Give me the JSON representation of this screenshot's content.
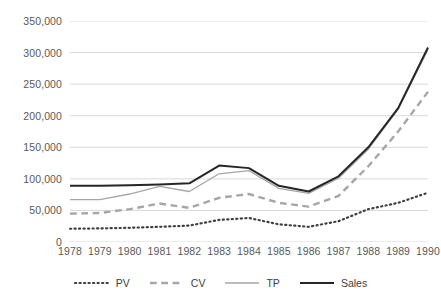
{
  "chart_data": {
    "type": "line",
    "title": "",
    "subtitle": "",
    "xlabel": "",
    "ylabel": "",
    "categories": [
      "1978",
      "1979",
      "1980",
      "1981",
      "1982",
      "1983",
      "1984",
      "1985",
      "1986",
      "1987",
      "1988",
      "1989",
      "1990"
    ],
    "x": [
      1978,
      1979,
      1980,
      1981,
      1982,
      1983,
      1984,
      1985,
      1986,
      1987,
      1989,
      1989,
      1990
    ],
    "ylim": [
      0,
      350000
    ],
    "xlim": [
      "1978",
      "1990"
    ],
    "y_ticks": [
      0,
      50000,
      100000,
      150000,
      200000,
      250000,
      300000,
      350000
    ],
    "y_tick_labels": [
      "0",
      "50,000",
      "100,000",
      "150,000",
      "200,000",
      "250,000",
      "300,000",
      "350,000"
    ],
    "grid": true,
    "grid_axis": "y",
    "legend_position": "bottom",
    "series": [
      {
        "name": "PV",
        "style": "dotted",
        "color": "#404040",
        "width": 2.2,
        "values": [
          21000,
          21500,
          22500,
          24000,
          26000,
          35000,
          38000,
          28000,
          24000,
          33000,
          52000,
          62000,
          78000
        ]
      },
      {
        "name": "CV",
        "style": "dashed",
        "color": "#a6a6a6",
        "width": 2.4,
        "values": [
          45000,
          46000,
          52000,
          61000,
          54000,
          70000,
          76000,
          62000,
          56000,
          73000,
          120000,
          175000,
          238000
        ]
      },
      {
        "name": "TP",
        "style": "solid",
        "color": "#a6a6a6",
        "width": 1.3,
        "values": [
          67000,
          67000,
          76000,
          88000,
          80000,
          108000,
          113000,
          85000,
          77000,
          101000,
          147000,
          210000,
          305000
        ]
      },
      {
        "name": "Sales",
        "style": "solid",
        "color": "#262626",
        "width": 2.0,
        "values": [
          89000,
          89000,
          90000,
          91000,
          93000,
          121000,
          117000,
          89000,
          80000,
          104000,
          150000,
          212000,
          308000
        ]
      }
    ]
  },
  "legend": {
    "items": [
      {
        "label": "PV"
      },
      {
        "label": "CV"
      },
      {
        "label": "TP"
      },
      {
        "label": "Sales"
      }
    ]
  },
  "colors": {
    "background": "#ffffff",
    "gridline": "#d9d9d9",
    "tick_text": "#595959",
    "legend_text": "#404040"
  }
}
